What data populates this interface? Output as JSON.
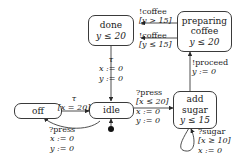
{
  "diagram": {
    "type": "timed-automaton",
    "background_color": "#ffffff",
    "stroke_color": "#3a3a3a",
    "text_color": "#1a1a1a"
  },
  "states": [
    {
      "id": "off",
      "name_line1": "off",
      "invariant": ""
    },
    {
      "id": "idle",
      "name_line1": "idle",
      "invariant": "",
      "initial": true
    },
    {
      "id": "done",
      "name_line1": "done",
      "invariant": "y ≤ 20"
    },
    {
      "id": "preparing_coffee",
      "name_line1": "preparing",
      "name_line2": "coffee",
      "invariant": "y ≤ 20"
    },
    {
      "id": "add_sugar",
      "name_line1": "add",
      "name_line2": "sugar",
      "invariant": "y ≤ 15"
    }
  ],
  "transitions": [
    {
      "id": "off-to-idle",
      "from": "off",
      "to": "idle",
      "action": "τ",
      "guard": "[x = 20]",
      "reset": ""
    },
    {
      "id": "idle-to-off",
      "from": "idle",
      "to": "off",
      "action": "?press",
      "guard": "",
      "reset_1": "x := 0",
      "reset_2": "y := 0"
    },
    {
      "id": "done-to-idle",
      "from": "done",
      "to": "idle",
      "action": "τ",
      "guard": "",
      "reset_1": "x := 0",
      "reset_2": "y := 0"
    },
    {
      "id": "idle-to-add-sugar",
      "from": "idle",
      "to": "add_sugar",
      "action": "?press",
      "guard": "[x ≤ 20]",
      "reset_1": "x := 0",
      "reset_2": "y := 0"
    },
    {
      "id": "add-sugar-self-loop",
      "from": "add_sugar",
      "to": "add_sugar",
      "action": "?sugar",
      "guard": "[x ≥ 10]",
      "reset": "x := 0"
    },
    {
      "id": "add-sugar-to-preparing",
      "from": "add_sugar",
      "to": "preparing_coffee",
      "action": "!proceed",
      "guard": "",
      "reset": "y := 0"
    },
    {
      "id": "preparing-to-done-upper",
      "from": "preparing_coffee",
      "to": "done",
      "action": "!coffee",
      "guard": "[y > 15]",
      "reset": ""
    },
    {
      "id": "preparing-to-done-lower",
      "from": "preparing_coffee",
      "to": "done",
      "action": "!coffee",
      "guard": "[y ≤ 15]",
      "reset": ""
    }
  ]
}
